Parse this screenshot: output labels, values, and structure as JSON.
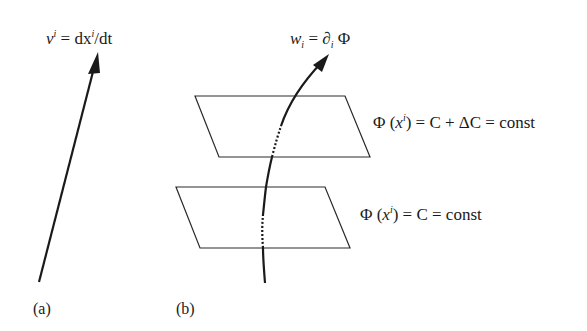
{
  "figure": {
    "panels": [
      {
        "id": "a",
        "label": "(a)",
        "equation": {
          "lhs_symbol": "v",
          "lhs_superscript": "i",
          "equals": " = ",
          "rhs": "dx",
          "rhs_superscript": "i",
          "rhs_tail": "/dt"
        },
        "description": "Straight arrow representing contravariant vector (velocity)"
      },
      {
        "id": "b",
        "label": "(b)",
        "equation": {
          "lhs_symbol": "w",
          "lhs_subscript": "i",
          "equals": " = ",
          "rhs": "∂",
          "rhs_subscript": "i",
          "rhs_tail": " Φ"
        },
        "surfaces": [
          {
            "name": "upper-level-surface",
            "text_prefix": "Φ (",
            "text_var": "x",
            "text_sup": "i",
            "text_suffix": ") = C + ΔC = const"
          },
          {
            "name": "lower-level-surface",
            "text_prefix": "Φ (",
            "text_var": "x",
            "text_sup": "i",
            "text_suffix": ") = C = const"
          }
        ],
        "description": "Curved arrow crossing level surfaces representing covariant vector (gradient)"
      }
    ],
    "colors": {
      "stroke": "#1a1a1a",
      "background": "#ffffff"
    }
  }
}
